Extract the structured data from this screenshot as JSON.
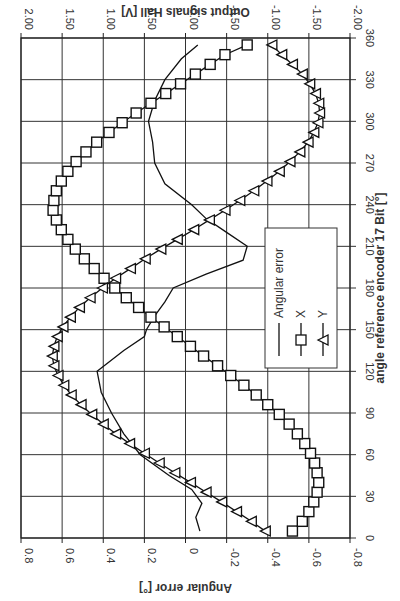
{
  "chart_data": {
    "type": "line",
    "orientation_note": "figure rotated 90 degrees clockwise",
    "title": "",
    "xlabel": "angle reference encoder 17 Bit [°]",
    "ylabel": "Angular error [°]",
    "y2label": "Output signals Hall [V]",
    "xlim": [
      0,
      360
    ],
    "ylim": [
      -0.8,
      0.8
    ],
    "y2lim": [
      -2.0,
      2.0
    ],
    "x_ticks": [
      "0",
      "30",
      "60",
      "90",
      "120",
      "150",
      "180",
      "210",
      "240",
      "270",
      "300",
      "330",
      "360"
    ],
    "y_ticks": [
      "-0.8",
      "-0.6",
      "-0.4",
      "-0.2",
      "0",
      "0.2",
      "0.4",
      "0.6",
      "0.8"
    ],
    "y2_ticks": [
      "-2.00",
      "-1.50",
      "-1.00",
      "-0.50",
      "0.00",
      "0.50",
      "1.00",
      "1.50",
      "2.00"
    ],
    "grid": true,
    "legend_position": "inside",
    "legend": [
      "Angular error",
      "X",
      "Y"
    ],
    "series": [
      {
        "name": "Angular error",
        "axis": "left",
        "marker": "none",
        "x": [
          5,
          15,
          25,
          35,
          45,
          60,
          75,
          90,
          105,
          120,
          135,
          145,
          150,
          160,
          170,
          180,
          190,
          200,
          210,
          220,
          230,
          240,
          255,
          270,
          285,
          300,
          315,
          330,
          345,
          355
        ],
        "values": [
          -0.07,
          -0.05,
          -0.08,
          -0.03,
          0.08,
          0.22,
          0.3,
          0.36,
          0.41,
          0.43,
          0.3,
          0.2,
          0.19,
          0.15,
          0.1,
          0.06,
          -0.1,
          -0.28,
          -0.3,
          -0.2,
          -0.1,
          -0.03,
          0.1,
          0.15,
          0.16,
          0.18,
          0.15,
          0.1,
          0.02,
          -0.06
        ]
      },
      {
        "name": "X",
        "axis": "right",
        "marker": "square",
        "x": [
          5,
          12,
          19,
          26,
          33,
          40,
          47,
          54,
          61,
          68,
          75,
          82,
          89,
          96,
          103,
          110,
          117,
          124,
          131,
          138,
          145,
          152,
          159,
          166,
          173,
          180,
          187,
          194,
          201,
          208,
          215,
          222,
          229,
          236,
          243,
          250,
          257,
          264,
          271,
          278,
          285,
          292,
          299,
          306,
          313,
          320,
          327,
          334,
          341,
          348,
          355
        ],
        "values": [
          -1.3,
          -1.42,
          -1.5,
          -1.56,
          -1.6,
          -1.62,
          -1.6,
          -1.57,
          -1.52,
          -1.45,
          -1.36,
          -1.26,
          -1.14,
          -1.0,
          -0.86,
          -0.71,
          -0.55,
          -0.39,
          -0.22,
          -0.06,
          0.1,
          0.26,
          0.42,
          0.57,
          0.72,
          0.86,
          0.99,
          1.11,
          1.23,
          1.34,
          1.43,
          1.51,
          1.57,
          1.61,
          1.6,
          1.57,
          1.51,
          1.43,
          1.33,
          1.21,
          1.08,
          0.93,
          0.77,
          0.6,
          0.42,
          0.24,
          0.06,
          -0.12,
          -0.3,
          -0.48,
          -0.75
        ]
      },
      {
        "name": "Y",
        "axis": "right",
        "marker": "triangle",
        "x": [
          5,
          12,
          19,
          26,
          33,
          40,
          47,
          54,
          61,
          68,
          75,
          82,
          89,
          96,
          103,
          110,
          117,
          124,
          131,
          138,
          145,
          152,
          159,
          166,
          173,
          180,
          187,
          194,
          201,
          208,
          215,
          222,
          229,
          236,
          243,
          250,
          257,
          264,
          271,
          278,
          285,
          292,
          299,
          306,
          313,
          320,
          327,
          334,
          341,
          348,
          355
        ],
        "values": [
          -0.97,
          -0.8,
          -0.62,
          -0.44,
          -0.25,
          -0.06,
          0.13,
          0.32,
          0.5,
          0.68,
          0.85,
          1.0,
          1.14,
          1.27,
          1.39,
          1.48,
          1.55,
          1.6,
          1.62,
          1.6,
          1.56,
          1.49,
          1.4,
          1.29,
          1.16,
          1.01,
          0.85,
          0.67,
          0.49,
          0.3,
          0.1,
          -0.1,
          -0.29,
          -0.48,
          -0.66,
          -0.83,
          -0.99,
          -1.14,
          -1.27,
          -1.39,
          -1.49,
          -1.56,
          -1.61,
          -1.63,
          -1.62,
          -1.58,
          -1.51,
          -1.42,
          -1.3,
          -1.17,
          -1.05
        ]
      }
    ]
  },
  "labels": {
    "x_axis_title": "angle reference encoder 17 Bit [°]",
    "left_axis_title": "Angular error [°]",
    "right_axis_title": "Output signals Hall [V]",
    "legend_items": [
      "Angular error",
      "X",
      "Y"
    ]
  }
}
